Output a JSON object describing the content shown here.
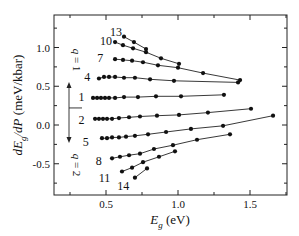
{
  "chart_data": {
    "type": "line",
    "title": "",
    "xlabel": "E_g (eV)",
    "ylabel": "dE_g/dP (meV/kbar)",
    "xlim": [
      0.15,
      1.77
    ],
    "ylim": [
      -0.9,
      1.35
    ],
    "x_ticks": [
      0.5,
      1.0,
      1.5
    ],
    "x_tick_labels": [
      "0.5",
      "1.0",
      "1.5"
    ],
    "x_minor_ticks": [
      0.25,
      0.75,
      1.25,
      1.75
    ],
    "y_ticks": [
      -0.5,
      0.0,
      0.5,
      1.0
    ],
    "y_tick_labels": [
      "-0.5",
      "0.0",
      "0.5",
      "1.0"
    ],
    "y_minor_ticks": [
      -0.75,
      -0.25,
      0.25,
      0.75,
      1.25
    ],
    "grid": false,
    "legend": null,
    "annotations": {
      "arrow_up_label": "q = 1",
      "arrow_down_label": "q = 2",
      "arrow_split_y": 0.22
    },
    "series": [
      {
        "name": "13",
        "x": [
          0.625,
          0.694,
          0.778
        ],
        "y": [
          1.14,
          1.07,
          0.98
        ]
      },
      {
        "name": "10",
        "x": [
          0.563,
          0.618,
          0.688,
          0.778,
          0.882,
          1.007
        ],
        "y": [
          1.07,
          1.03,
          0.99,
          0.94,
          0.86,
          0.79
        ]
      },
      {
        "name": "7",
        "x": [
          0.563,
          0.618,
          0.681,
          0.757,
          0.861,
          1.0,
          1.174,
          1.431
        ],
        "y": [
          0.85,
          0.84,
          0.83,
          0.81,
          0.77,
          0.74,
          0.67,
          0.58
        ]
      },
      {
        "name": "4",
        "x": [
          0.451,
          0.486,
          0.521,
          0.563,
          0.625,
          0.701,
          0.806,
          0.972,
          1.417
        ],
        "y": [
          0.6,
          0.62,
          0.62,
          0.62,
          0.61,
          0.61,
          0.59,
          0.57,
          0.55
        ]
      },
      {
        "name": "1",
        "x": [
          0.41,
          0.438,
          0.465,
          0.493,
          0.521,
          0.563,
          0.625,
          0.722,
          0.847,
          1.021,
          1.319
        ],
        "y": [
          0.35,
          0.35,
          0.35,
          0.35,
          0.35,
          0.35,
          0.36,
          0.36,
          0.37,
          0.37,
          0.39
        ]
      },
      {
        "name": "2",
        "x": [
          0.424,
          0.451,
          0.479,
          0.507,
          0.542,
          0.59,
          0.66,
          0.736,
          0.854,
          1.007,
          1.208,
          1.507
        ],
        "y": [
          0.08,
          0.08,
          0.08,
          0.08,
          0.08,
          0.09,
          0.1,
          0.11,
          0.12,
          0.13,
          0.16,
          0.21
        ]
      },
      {
        "name": "5",
        "x": [
          0.472,
          0.507,
          0.542,
          0.59,
          0.639,
          0.701,
          0.792,
          0.917,
          1.09,
          1.313,
          1.66
        ],
        "y": [
          -0.17,
          -0.17,
          -0.16,
          -0.16,
          -0.15,
          -0.14,
          -0.12,
          -0.09,
          -0.05,
          -0.01,
          0.12
        ]
      },
      {
        "name": "8",
        "x": [
          0.542,
          0.597,
          0.66,
          0.736,
          0.833,
          0.965,
          1.132,
          1.361
        ],
        "y": [
          -0.43,
          -0.41,
          -0.39,
          -0.37,
          -0.31,
          -0.26,
          -0.19,
          -0.12
        ]
      },
      {
        "name": "11",
        "x": [
          0.611,
          0.681,
          0.757,
          0.868,
          0.979
        ],
        "y": [
          -0.6,
          -0.55,
          -0.48,
          -0.41,
          -0.34
        ]
      },
      {
        "name": "14",
        "x": [
          0.701,
          0.785
        ],
        "y": [
          -0.68,
          -0.56
        ]
      }
    ],
    "series_label_positions": {
      "13": [
        0.57,
        1.2
      ],
      "10": [
        0.5,
        1.09
      ],
      "7": [
        0.46,
        0.87
      ],
      "4": [
        0.37,
        0.62
      ],
      "1": [
        0.33,
        0.36
      ],
      "2": [
        0.33,
        0.06
      ],
      "5": [
        0.36,
        -0.22
      ],
      "8": [
        0.45,
        -0.47
      ],
      "11": [
        0.49,
        -0.68
      ],
      "14": [
        0.62,
        -0.79
      ]
    }
  }
}
